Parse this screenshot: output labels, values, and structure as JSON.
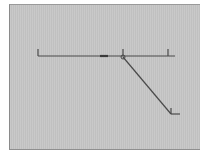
{
  "canvas": {
    "background": "#c6c6c6",
    "stroke": "#4a4a4a",
    "frame": {
      "x": 9,
      "y": 4,
      "width": 191,
      "height": 146
    }
  },
  "diagram": {
    "main_line": {
      "x1": 38,
      "y1": 56,
      "x2": 175,
      "y2": 56
    },
    "ticks": [
      {
        "name": "tick-left",
        "x": 38,
        "y_top": 49,
        "y_bottom": 56
      },
      {
        "name": "tick-middle",
        "x": 123,
        "y_top": 49,
        "y_bottom": 56
      },
      {
        "name": "tick-right",
        "x": 168,
        "y_top": 49,
        "y_bottom": 56
      }
    ],
    "dash": {
      "x1": 100,
      "x2": 108,
      "y": 56
    },
    "junction": {
      "cx": 123,
      "cy": 57,
      "r": 2
    },
    "branch_line": {
      "x1": 123,
      "y1": 57,
      "x2": 171,
      "y2": 114
    },
    "end_marker": {
      "x": 171,
      "y_top": 108,
      "y_bottom": 114,
      "x_end": 180
    }
  }
}
